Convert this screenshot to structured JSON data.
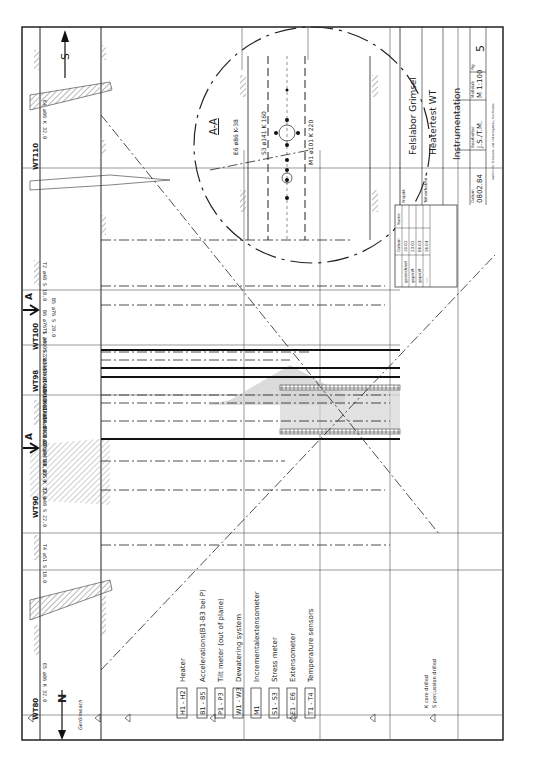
{
  "title_block": {
    "projekt_label": "Projekt",
    "projekt": "Felslabor Grimsel",
    "teilvorhaben_label": "Teilvorhaben",
    "teilvorhaben": "Heatertest WT",
    "title": "Instrumentation",
    "datum_label": "Datum",
    "datum": "0802.84",
    "bearbeiter_label": "Bearbeiter",
    "bearbeiter": "J.S./T.M.",
    "massstab_label": "Maßstab",
    "massstab": "M 1:100",
    "fig_label": "Fig",
    "fig": "5",
    "footer": "Institut für Strassen- und Untertagebau, Kaufmann"
  },
  "revision_table": {
    "headers": [
      "",
      "Datum",
      "Name"
    ],
    "rows": [
      [
        "gezeichnet",
        "10.02",
        "Sig."
      ],
      [
        "geprüft",
        "23.02",
        "Sig."
      ],
      [
        "geprüft",
        "06.03",
        "Sig."
      ],
      [
        "----",
        "26.04",
        "Sig."
      ]
    ]
  },
  "section": {
    "label": "A-A",
    "annotations": [
      "E6 ø86 K-38",
      "S3 ø141 K 160",
      "M1 ø101 K 220"
    ]
  },
  "legend": {
    "items": [
      {
        "code": "H1 - H2",
        "desc": "Heater"
      },
      {
        "code": "B1 - B5",
        "desc": "Accelerations(B1-B3 bei P)"
      },
      {
        "code": "P1 - P3",
        "desc": "Tilt meter   (out of plane)"
      },
      {
        "code": "W1 - W3",
        "desc": "Dewatering system"
      },
      {
        "code": "M1",
        "desc": "Incrementalextensometer"
      },
      {
        "code": "S1 - S3",
        "desc": "Stress meter"
      },
      {
        "code": "E1 - E6",
        "desc": "Extensometer"
      },
      {
        "code": "T1 - T4",
        "desc": "Temperature sensors"
      }
    ],
    "notes": [
      "K  core drilled",
      "S  percussion drilled"
    ]
  },
  "tunnel_markers": [
    "WT110",
    "WT100",
    "WT98",
    "WT90",
    "WT80"
  ],
  "section_marker": "A",
  "north_label": "N",
  "south_label": "S",
  "north_note": "Gerölmeach",
  "boreholes": [
    "E4 ø86 K 32.0",
    "T2 ø48 S 18.0",
    "B5 ø76 S 20.0",
    "B6 ø76 S 30.0",
    "T1 ø48 S 22.0",
    "S2 ø141 K 16.0",
    "W3 ø86 K 22.0",
    "S1 ø141 K 16.0",
    "E2 ø141 K 22.0",
    "H1 ø305 K 18.2",
    "E1 ø141 K 22.0",
    "E1 ø86 K 22.0",
    "W1 ø86 K 22.0",
    "H2 ø305 K 18.2",
    "E3 ø141 K 22.0",
    "W2 ø86 K 32.0",
    "T3 ø48 S 22.0",
    "T4 ø51 S 18.0",
    "E5 ø86 K 32.0"
  ],
  "colors": {
    "ink": "#222222",
    "hatch": "#9a9a9a",
    "background": "#ffffff"
  }
}
